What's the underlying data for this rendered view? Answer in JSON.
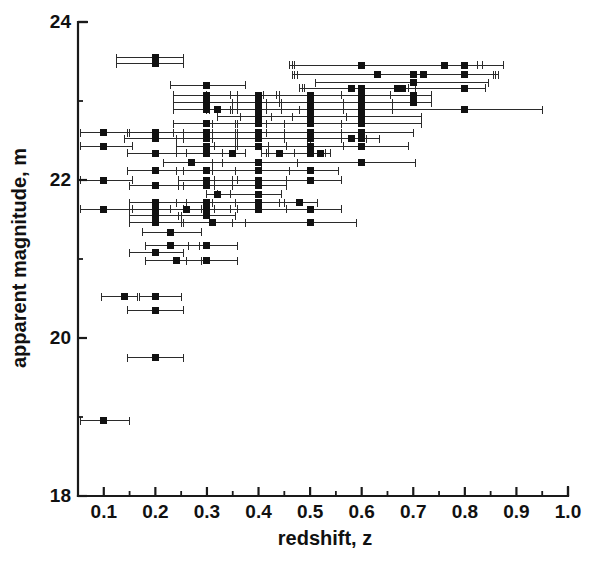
{
  "chart_data": {
    "type": "scatter",
    "title": "",
    "xlabel": "redshift, z",
    "ylabel": "apparent magnitude, m",
    "xlim": [
      0.05,
      1.0
    ],
    "ylim": [
      18,
      24
    ],
    "grid": false,
    "legend": null,
    "marker": "filled-square",
    "error_bars": "x-direction only (horizontal), with end caps",
    "x_ticks_major": [
      0.1,
      0.2,
      0.3,
      0.4,
      0.5,
      0.6,
      0.7,
      0.8,
      0.9,
      1.0
    ],
    "x_tick_labels": [
      "0.1",
      "0.2",
      "0.3",
      "0.4",
      "0.5",
      "0.6",
      "0.7",
      "0.8",
      "0.9",
      "1.0"
    ],
    "x_ticks_minor": [
      0.15,
      0.25,
      0.35,
      0.45,
      0.55,
      0.65,
      0.75,
      0.85,
      0.95
    ],
    "y_ticks_major": [
      18,
      20,
      22,
      24
    ],
    "y_tick_labels": [
      "18",
      "20",
      "22",
      "24"
    ],
    "y_ticks_minor": [
      19,
      21,
      23
    ],
    "n_points": 118,
    "points": [
      {
        "x": 0.2,
        "y": 23.55,
        "xerr_lo": 0.075,
        "xerr_hi": 0.055
      },
      {
        "x": 0.2,
        "y": 23.47,
        "xerr_lo": 0.075,
        "xerr_hi": 0.055
      },
      {
        "x": 0.6,
        "y": 23.45,
        "xerr_lo": 0.135,
        "xerr_hi": 0.275
      },
      {
        "x": 0.76,
        "y": 23.45,
        "xerr_lo": 0.3,
        "xerr_hi": 0.065
      },
      {
        "x": 0.8,
        "y": 23.45,
        "xerr_lo": 0.33,
        "xerr_hi": 0.035
      },
      {
        "x": 0.63,
        "y": 23.33,
        "xerr_lo": 0.155,
        "xerr_hi": 0.235
      },
      {
        "x": 0.7,
        "y": 23.33,
        "xerr_lo": 0.235,
        "xerr_hi": 0.155
      },
      {
        "x": 0.72,
        "y": 23.33,
        "xerr_lo": 0.255,
        "xerr_hi": 0.135
      },
      {
        "x": 0.8,
        "y": 23.33,
        "xerr_lo": 0.33,
        "xerr_hi": 0.06
      },
      {
        "x": 0.7,
        "y": 23.23,
        "xerr_lo": 0.19,
        "xerr_hi": 0.145
      },
      {
        "x": 0.3,
        "y": 23.2,
        "xerr_lo": 0.07,
        "xerr_hi": 0.075
      },
      {
        "x": 0.58,
        "y": 23.16,
        "xerr_lo": 0.1,
        "xerr_hi": 0.11
      },
      {
        "x": 0.6,
        "y": 23.16,
        "xerr_lo": 0.115,
        "xerr_hi": 0.09
      },
      {
        "x": 0.67,
        "y": 23.16,
        "xerr_lo": 0.18,
        "xerr_hi": 0.035
      },
      {
        "x": 0.68,
        "y": 23.16,
        "xerr_lo": 0.19,
        "xerr_hi": 0.025
      },
      {
        "x": 0.8,
        "y": 23.16,
        "xerr_lo": 0.31,
        "xerr_hi": 0.04
      },
      {
        "x": 0.3,
        "y": 23.07,
        "xerr_lo": 0.065,
        "xerr_hi": 0.06
      },
      {
        "x": 0.4,
        "y": 23.07,
        "xerr_lo": 0.1,
        "xerr_hi": 0.04
      },
      {
        "x": 0.5,
        "y": 23.07,
        "xerr_lo": 0.155,
        "xerr_hi": 0.06
      },
      {
        "x": 0.6,
        "y": 23.07,
        "xerr_lo": 0.19,
        "xerr_hi": 0.055
      },
      {
        "x": 0.7,
        "y": 23.07,
        "xerr_lo": 0.265,
        "xerr_hi": 0.035
      },
      {
        "x": 0.3,
        "y": 22.98,
        "xerr_lo": 0.065,
        "xerr_hi": 0.06
      },
      {
        "x": 0.4,
        "y": 22.98,
        "xerr_lo": 0.095,
        "xerr_hi": 0.045
      },
      {
        "x": 0.5,
        "y": 22.98,
        "xerr_lo": 0.15,
        "xerr_hi": 0.065
      },
      {
        "x": 0.6,
        "y": 22.98,
        "xerr_lo": 0.185,
        "xerr_hi": 0.06
      },
      {
        "x": 0.7,
        "y": 22.98,
        "xerr_lo": 0.26,
        "xerr_hi": 0.035
      },
      {
        "x": 0.3,
        "y": 22.89,
        "xerr_lo": 0.065,
        "xerr_hi": 0.06
      },
      {
        "x": 0.32,
        "y": 22.89,
        "xerr_lo": 0.02,
        "xerr_hi": 0.025
      },
      {
        "x": 0.4,
        "y": 22.89,
        "xerr_lo": 0.095,
        "xerr_hi": 0.045
      },
      {
        "x": 0.5,
        "y": 22.89,
        "xerr_lo": 0.15,
        "xerr_hi": 0.065
      },
      {
        "x": 0.6,
        "y": 22.89,
        "xerr_lo": 0.185,
        "xerr_hi": 0.06
      },
      {
        "x": 0.8,
        "y": 22.89,
        "xerr_lo": 0.32,
        "xerr_hi": 0.15
      },
      {
        "x": 0.4,
        "y": 22.8,
        "xerr_lo": 0.08,
        "xerr_hi": 0.065
      },
      {
        "x": 0.5,
        "y": 22.8,
        "xerr_lo": 0.135,
        "xerr_hi": 0.07
      },
      {
        "x": 0.6,
        "y": 22.8,
        "xerr_lo": 0.175,
        "xerr_hi": 0.115
      },
      {
        "x": 0.3,
        "y": 22.71,
        "xerr_lo": 0.065,
        "xerr_hi": 0.06
      },
      {
        "x": 0.4,
        "y": 22.71,
        "xerr_lo": 0.09,
        "xerr_hi": 0.05
      },
      {
        "x": 0.5,
        "y": 22.71,
        "xerr_lo": 0.145,
        "xerr_hi": 0.06
      },
      {
        "x": 0.6,
        "y": 22.71,
        "xerr_lo": 0.185,
        "xerr_hi": 0.115
      },
      {
        "x": 0.1,
        "y": 22.6,
        "xerr_lo": 0.045,
        "xerr_hi": 0.05
      },
      {
        "x": 0.2,
        "y": 22.6,
        "xerr_lo": 0.055,
        "xerr_hi": 0.055
      },
      {
        "x": 0.3,
        "y": 22.6,
        "xerr_lo": 0.065,
        "xerr_hi": 0.06
      },
      {
        "x": 0.4,
        "y": 22.6,
        "xerr_lo": 0.09,
        "xerr_hi": 0.05
      },
      {
        "x": 0.5,
        "y": 22.6,
        "xerr_lo": 0.145,
        "xerr_hi": 0.06
      },
      {
        "x": 0.6,
        "y": 22.6,
        "xerr_lo": 0.185,
        "xerr_hi": 0.1
      },
      {
        "x": 0.2,
        "y": 22.52,
        "xerr_lo": 0.06,
        "xerr_hi": 0.055
      },
      {
        "x": 0.3,
        "y": 22.52,
        "xerr_lo": 0.06,
        "xerr_hi": 0.06
      },
      {
        "x": 0.4,
        "y": 22.52,
        "xerr_lo": 0.09,
        "xerr_hi": 0.05
      },
      {
        "x": 0.5,
        "y": 22.52,
        "xerr_lo": 0.145,
        "xerr_hi": 0.06
      },
      {
        "x": 0.58,
        "y": 22.52,
        "xerr_lo": 0.085,
        "xerr_hi": 0.03
      },
      {
        "x": 0.6,
        "y": 22.52,
        "xerr_lo": 0.1,
        "xerr_hi": 0.035
      },
      {
        "x": 0.1,
        "y": 22.43,
        "xerr_lo": 0.045,
        "xerr_hi": 0.055
      },
      {
        "x": 0.3,
        "y": 22.43,
        "xerr_lo": 0.06,
        "xerr_hi": 0.055
      },
      {
        "x": 0.4,
        "y": 22.43,
        "xerr_lo": 0.085,
        "xerr_hi": 0.055
      },
      {
        "x": 0.5,
        "y": 22.43,
        "xerr_lo": 0.14,
        "xerr_hi": 0.065
      },
      {
        "x": 0.6,
        "y": 22.43,
        "xerr_lo": 0.18,
        "xerr_hi": 0.09
      },
      {
        "x": 0.2,
        "y": 22.34,
        "xerr_lo": 0.055,
        "xerr_hi": 0.06
      },
      {
        "x": 0.3,
        "y": 22.34,
        "xerr_lo": 0.06,
        "xerr_hi": 0.055
      },
      {
        "x": 0.35,
        "y": 22.34,
        "xerr_lo": 0.02,
        "xerr_hi": 0.025
      },
      {
        "x": 0.44,
        "y": 22.34,
        "xerr_lo": 0.035,
        "xerr_hi": 0.03
      },
      {
        "x": 0.5,
        "y": 22.34,
        "xerr_lo": 0.085,
        "xerr_hi": 0.03
      },
      {
        "x": 0.52,
        "y": 22.34,
        "xerr_lo": 0.1,
        "xerr_hi": 0.02
      },
      {
        "x": 0.27,
        "y": 22.22,
        "xerr_lo": 0.055,
        "xerr_hi": 0.06
      },
      {
        "x": 0.4,
        "y": 22.22,
        "xerr_lo": 0.09,
        "xerr_hi": 0.075
      },
      {
        "x": 0.6,
        "y": 22.22,
        "xerr_lo": 0.195,
        "xerr_hi": 0.105
      },
      {
        "x": 0.2,
        "y": 22.12,
        "xerr_lo": 0.055,
        "xerr_hi": 0.055
      },
      {
        "x": 0.3,
        "y": 22.12,
        "xerr_lo": 0.06,
        "xerr_hi": 0.055
      },
      {
        "x": 0.4,
        "y": 22.12,
        "xerr_lo": 0.09,
        "xerr_hi": 0.06
      },
      {
        "x": 0.5,
        "y": 22.12,
        "xerr_lo": 0.145,
        "xerr_hi": 0.055
      },
      {
        "x": 0.1,
        "y": 22.0,
        "xerr_lo": 0.045,
        "xerr_hi": 0.055
      },
      {
        "x": 0.3,
        "y": 22.0,
        "xerr_lo": 0.055,
        "xerr_hi": 0.05
      },
      {
        "x": 0.4,
        "y": 22.0,
        "xerr_lo": 0.085,
        "xerr_hi": 0.055
      },
      {
        "x": 0.5,
        "y": 22.0,
        "xerr_lo": 0.14,
        "xerr_hi": 0.06
      },
      {
        "x": 0.2,
        "y": 21.93,
        "xerr_lo": 0.05,
        "xerr_hi": 0.055
      },
      {
        "x": 0.3,
        "y": 21.93,
        "xerr_lo": 0.055,
        "xerr_hi": 0.05
      },
      {
        "x": 0.4,
        "y": 21.93,
        "xerr_lo": 0.085,
        "xerr_hi": 0.055
      },
      {
        "x": 0.32,
        "y": 21.82,
        "xerr_lo": 0.02,
        "xerr_hi": 0.025
      },
      {
        "x": 0.4,
        "y": 21.82,
        "xerr_lo": 0.08,
        "xerr_hi": 0.045
      },
      {
        "x": 0.2,
        "y": 21.71,
        "xerr_lo": 0.05,
        "xerr_hi": 0.06
      },
      {
        "x": 0.3,
        "y": 21.71,
        "xerr_lo": 0.06,
        "xerr_hi": 0.055
      },
      {
        "x": 0.4,
        "y": 21.71,
        "xerr_lo": 0.09,
        "xerr_hi": 0.05
      },
      {
        "x": 0.48,
        "y": 21.71,
        "xerr_lo": 0.04,
        "xerr_hi": 0.035
      },
      {
        "x": 0.1,
        "y": 21.63,
        "xerr_lo": 0.045,
        "xerr_hi": 0.055
      },
      {
        "x": 0.2,
        "y": 21.63,
        "xerr_lo": 0.05,
        "xerr_hi": 0.055
      },
      {
        "x": 0.26,
        "y": 21.63,
        "xerr_lo": 0.03,
        "xerr_hi": 0.03
      },
      {
        "x": 0.3,
        "y": 21.63,
        "xerr_lo": 0.045,
        "xerr_hi": 0.045
      },
      {
        "x": 0.4,
        "y": 21.63,
        "xerr_lo": 0.085,
        "xerr_hi": 0.055
      },
      {
        "x": 0.5,
        "y": 21.63,
        "xerr_lo": 0.14,
        "xerr_hi": 0.06
      },
      {
        "x": 0.2,
        "y": 21.55,
        "xerr_lo": 0.05,
        "xerr_hi": 0.05
      },
      {
        "x": 0.3,
        "y": 21.55,
        "xerr_lo": 0.055,
        "xerr_hi": 0.055
      },
      {
        "x": 0.2,
        "y": 21.46,
        "xerr_lo": 0.05,
        "xerr_hi": 0.055
      },
      {
        "x": 0.31,
        "y": 21.46,
        "xerr_lo": 0.06,
        "xerr_hi": 0.065
      },
      {
        "x": 0.5,
        "y": 21.46,
        "xerr_lo": 0.15,
        "xerr_hi": 0.09
      },
      {
        "x": 0.23,
        "y": 21.34,
        "xerr_lo": 0.055,
        "xerr_hi": 0.06
      },
      {
        "x": 0.23,
        "y": 21.17,
        "xerr_lo": 0.05,
        "xerr_hi": 0.055
      },
      {
        "x": 0.3,
        "y": 21.17,
        "xerr_lo": 0.035,
        "xerr_hi": 0.06
      },
      {
        "x": 0.2,
        "y": 21.08,
        "xerr_lo": 0.05,
        "xerr_hi": 0.055
      },
      {
        "x": 0.24,
        "y": 20.98,
        "xerr_lo": 0.06,
        "xerr_hi": 0.05
      },
      {
        "x": 0.3,
        "y": 20.98,
        "xerr_lo": 0.04,
        "xerr_hi": 0.06
      },
      {
        "x": 0.14,
        "y": 20.52,
        "xerr_lo": 0.045,
        "xerr_hi": 0.025
      },
      {
        "x": 0.2,
        "y": 20.52,
        "xerr_lo": 0.03,
        "xerr_hi": 0.05
      },
      {
        "x": 0.2,
        "y": 20.35,
        "xerr_lo": 0.055,
        "xerr_hi": 0.055
      },
      {
        "x": 0.2,
        "y": 19.75,
        "xerr_lo": 0.055,
        "xerr_hi": 0.055
      },
      {
        "x": 0.1,
        "y": 18.95,
        "xerr_lo": 0.045,
        "xerr_hi": 0.05
      }
    ]
  },
  "axes": {
    "x_title": "redshift, z",
    "y_title": "apparent magnitude, m",
    "x_labels": [
      "0.1",
      "0.2",
      "0.3",
      "0.4",
      "0.5",
      "0.6",
      "0.7",
      "0.8",
      "0.9",
      "1.0"
    ],
    "y_labels": [
      "18",
      "20",
      "22",
      "24"
    ]
  },
  "colors": {
    "axis": "#1a1a1a",
    "marker": "#111111",
    "errorbar": "#2b2b2b",
    "background": "#ffffff"
  }
}
